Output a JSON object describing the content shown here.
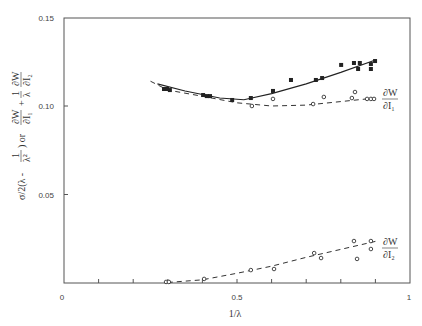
{
  "chart_data": {
    "type": "scatter",
    "title": "",
    "xlabel": "1/λ",
    "ylabel": "σ/2(λ - 1/λ²) or ∂W/∂I₁ + (1/λ) ∂W/∂I₂",
    "xlim": [
      0,
      1
    ],
    "ylim": [
      0,
      0.15
    ],
    "x_ticks": [
      0,
      0.1,
      0.2,
      0.3,
      0.4,
      0.5,
      0.6,
      0.7,
      0.8,
      0.9,
      1
    ],
    "x_tick_labels": [
      "0",
      "0.5",
      "1"
    ],
    "y_tick_labels": [
      "0.05",
      "0.10",
      "0.15"
    ],
    "grid": false,
    "series": [
      {
        "name": "σ/2(λ - 1/λ²)",
        "marker": "filled-square",
        "line": "solid",
        "points": [
          [
            0.289,
            0.1096
          ],
          [
            0.298,
            0.1096
          ],
          [
            0.306,
            0.109
          ],
          [
            0.402,
            0.1062
          ],
          [
            0.413,
            0.1056
          ],
          [
            0.422,
            0.1056
          ],
          [
            0.486,
            0.1034
          ],
          [
            0.54,
            0.1045
          ],
          [
            0.604,
            0.1085
          ],
          [
            0.656,
            0.1147
          ],
          [
            0.728,
            0.1147
          ],
          [
            0.746,
            0.1158
          ],
          [
            0.801,
            0.1232
          ],
          [
            0.838,
            0.1243
          ],
          [
            0.85,
            0.1209
          ],
          [
            0.855,
            0.1243
          ],
          [
            0.887,
            0.1237
          ],
          [
            0.887,
            0.1209
          ],
          [
            0.899,
            0.1254
          ]
        ]
      },
      {
        "name": "∂W/∂I₁",
        "marker": "open-circle",
        "line": "dashed",
        "points": [
          [
            0.543,
            0.1
          ],
          [
            0.604,
            0.104
          ],
          [
            0.72,
            0.1011
          ],
          [
            0.751,
            0.1051
          ],
          [
            0.832,
            0.1045
          ],
          [
            0.841,
            0.1079
          ],
          [
            0.876,
            0.104
          ],
          [
            0.887,
            0.104
          ],
          [
            0.896,
            0.104
          ]
        ]
      },
      {
        "name": "∂W/∂I₂",
        "marker": "open-circle",
        "line": "dashed",
        "points": [
          [
            0.295,
            0.0006
          ],
          [
            0.303,
            0.0006
          ],
          [
            0.405,
            0.0023
          ],
          [
            0.54,
            0.0073
          ],
          [
            0.607,
            0.0079
          ],
          [
            0.723,
            0.0169
          ],
          [
            0.743,
            0.0141
          ],
          [
            0.838,
            0.0237
          ],
          [
            0.847,
            0.0136
          ],
          [
            0.887,
            0.0237
          ],
          [
            0.887,
            0.0192
          ]
        ]
      }
    ],
    "curves": {
      "solid_fit": [
        [
          0.27,
          0.1125
        ],
        [
          0.35,
          0.1085
        ],
        [
          0.45,
          0.1045
        ],
        [
          0.52,
          0.1035
        ],
        [
          0.6,
          0.107
        ],
        [
          0.7,
          0.1125
        ],
        [
          0.8,
          0.119
        ],
        [
          0.9,
          0.126
        ]
      ],
      "dashed_l1": [
        [
          0.25,
          0.114
        ],
        [
          0.3,
          0.109
        ],
        [
          0.4,
          0.1055
        ],
        [
          0.5,
          0.1018
        ],
        [
          0.6,
          0.1
        ],
        [
          0.7,
          0.1005
        ],
        [
          0.8,
          0.1025
        ],
        [
          0.9,
          0.1045
        ]
      ],
      "dashed_l2": [
        [
          0.3,
          0.0003
        ],
        [
          0.4,
          0.0018
        ],
        [
          0.5,
          0.0055
        ],
        [
          0.6,
          0.0095
        ],
        [
          0.7,
          0.0145
        ],
        [
          0.8,
          0.019
        ],
        [
          0.9,
          0.0235
        ]
      ]
    },
    "annotations": [
      "∂W/∂I₁",
      "∂W/∂I₂"
    ]
  },
  "labels": {
    "x_axis": "1/λ",
    "y_axis_part1": "σ/2(λ - ",
    "y_axis_frac_num": "1",
    "y_axis_frac_den": "λ²",
    "y_axis_part2": ") or ",
    "y_dw": "∂W",
    "y_di1": "∂I₁",
    "y_plus": "+",
    "y_one": "1",
    "y_lambda": "λ",
    "y_di2": "∂I₂",
    "ann1_num": "∂W",
    "ann1_den": "∂I₁",
    "ann2_num": "∂W",
    "ann2_den": "∂I₂",
    "xt0": "0",
    "xt05": "0.5",
    "xt1": "1",
    "yt005": "0.05",
    "yt010": "0.10",
    "yt015": "0.15"
  }
}
